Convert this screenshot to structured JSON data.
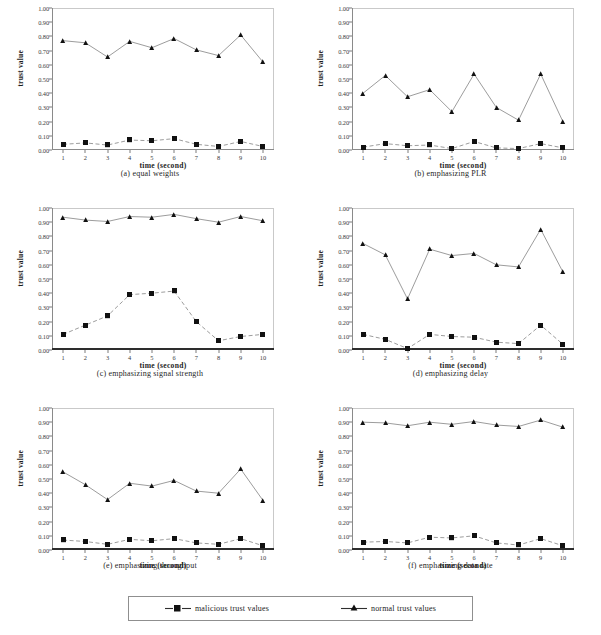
{
  "figure": {
    "xlabel": "time  (second)",
    "ylabel": "trust value",
    "x_ticks": [
      "1",
      "2",
      "3",
      "4",
      "5",
      "6",
      "7",
      "8",
      "9",
      "10"
    ],
    "y_ticks": [
      "1.00",
      "0.90",
      "0.80",
      "0.70",
      "0.60",
      "0.50",
      "0.40",
      "0.30",
      "0.20",
      "0.10",
      "0.00"
    ],
    "legend": {
      "malicious_label": "malicious trust values",
      "normal_label": "normal trust values",
      "malicious_marker": "square-marker-icon",
      "normal_marker": "triangle-marker-icon"
    },
    "colors": {
      "line": "#4a4a4a",
      "marker": "#111111",
      "axis": "#8a8a8a",
      "frame": "#c9c9c9"
    }
  },
  "chart_data": [
    {
      "type": "line",
      "panel": "a",
      "title": "(a)   equal weights",
      "xlabel": "time  (second)",
      "ylabel": "trust value",
      "x": [
        1,
        2,
        3,
        4,
        5,
        6,
        7,
        8,
        9,
        10
      ],
      "xlim": [
        0.5,
        10.5
      ],
      "ylim": [
        0,
        1
      ],
      "grid": false,
      "legend_position": "below-figure",
      "series": [
        {
          "name": "normal trust values",
          "marker": "triangle",
          "style": "solid",
          "values": [
            0.77,
            0.755,
            0.655,
            0.765,
            0.72,
            0.785,
            0.705,
            0.665,
            0.81,
            0.62
          ]
        },
        {
          "name": "malicious trust values",
          "marker": "square",
          "style": "dashed",
          "values": [
            0.04,
            0.05,
            0.035,
            0.07,
            0.065,
            0.08,
            0.04,
            0.025,
            0.06,
            0.025
          ]
        }
      ]
    },
    {
      "type": "line",
      "panel": "b",
      "title": "(b)   emphasizing PLR",
      "xlabel": "time  (second)",
      "ylabel": "trust value",
      "x": [
        1,
        2,
        3,
        4,
        5,
        6,
        7,
        8,
        9,
        10
      ],
      "xlim": [
        0.5,
        10.5
      ],
      "ylim": [
        0,
        1
      ],
      "grid": false,
      "legend_position": "below-figure",
      "series": [
        {
          "name": "normal trust values",
          "marker": "triangle",
          "style": "solid",
          "values": [
            0.4,
            0.525,
            0.375,
            0.425,
            0.27,
            0.535,
            0.3,
            0.21,
            0.535,
            0.2
          ]
        },
        {
          "name": "malicious trust values",
          "marker": "square",
          "style": "dashed",
          "values": [
            0.02,
            0.045,
            0.03,
            0.035,
            0.01,
            0.06,
            0.015,
            0.01,
            0.045,
            0.015
          ]
        }
      ]
    },
    {
      "type": "line",
      "panel": "c",
      "title": "(c)   emphasizing signal strength",
      "xlabel": "time  (second)",
      "ylabel": "trust value",
      "x": [
        1,
        2,
        3,
        4,
        5,
        6,
        7,
        8,
        9,
        10
      ],
      "xlim": [
        0.5,
        10.5
      ],
      "ylim": [
        0,
        1
      ],
      "grid": false,
      "legend_position": "below-figure",
      "series": [
        {
          "name": "normal trust values",
          "marker": "triangle",
          "style": "solid",
          "values": [
            0.935,
            0.915,
            0.905,
            0.94,
            0.935,
            0.955,
            0.925,
            0.9,
            0.94,
            0.91
          ]
        },
        {
          "name": "malicious trust values",
          "marker": "square",
          "style": "dashed",
          "values": [
            0.11,
            0.175,
            0.24,
            0.39,
            0.4,
            0.415,
            0.2,
            0.065,
            0.095,
            0.11
          ]
        }
      ]
    },
    {
      "type": "line",
      "panel": "d",
      "title": "(d)   emphasizing delay",
      "xlabel": "time  (second)",
      "ylabel": "trust value",
      "x": [
        1,
        2,
        3,
        4,
        5,
        6,
        7,
        8,
        9,
        10
      ],
      "xlim": [
        0.5,
        10.5
      ],
      "ylim": [
        0,
        1
      ],
      "grid": false,
      "legend_position": "below-figure",
      "series": [
        {
          "name": "normal trust values",
          "marker": "triangle",
          "style": "solid",
          "values": [
            0.75,
            0.67,
            0.36,
            0.71,
            0.665,
            0.68,
            0.6,
            0.585,
            0.85,
            0.55
          ]
        },
        {
          "name": "malicious trust values",
          "marker": "square",
          "style": "dashed",
          "values": [
            0.11,
            0.075,
            0.01,
            0.11,
            0.095,
            0.09,
            0.055,
            0.045,
            0.175,
            0.04
          ]
        }
      ]
    },
    {
      "type": "line",
      "panel": "e",
      "title": "(e)   emphasizing throughput",
      "xlabel": "time  (second)",
      "ylabel": "trust value",
      "x": [
        1,
        2,
        3,
        4,
        5,
        6,
        7,
        8,
        9,
        10
      ],
      "xlim": [
        0.5,
        10.5
      ],
      "ylim": [
        0,
        1
      ],
      "grid": false,
      "legend_position": "below-figure",
      "series": [
        {
          "name": "normal trust values",
          "marker": "triangle",
          "style": "solid",
          "values": [
            0.55,
            0.46,
            0.355,
            0.47,
            0.45,
            0.49,
            0.415,
            0.4,
            0.57,
            0.35
          ]
        },
        {
          "name": "malicious trust values",
          "marker": "square",
          "style": "dashed",
          "values": [
            0.07,
            0.06,
            0.04,
            0.075,
            0.065,
            0.08,
            0.05,
            0.04,
            0.08,
            0.03
          ]
        }
      ]
    },
    {
      "type": "line",
      "panel": "f",
      "title": "(f)   emphasizing data rate",
      "xlabel": "time  (second)",
      "ylabel": "trust value",
      "x": [
        1,
        2,
        3,
        4,
        5,
        6,
        7,
        8,
        9,
        10
      ],
      "xlim": [
        0.5,
        10.5
      ],
      "ylim": [
        0,
        1
      ],
      "grid": false,
      "legend_position": "below-figure",
      "series": [
        {
          "name": "normal trust values",
          "marker": "triangle",
          "style": "solid",
          "values": [
            0.9,
            0.895,
            0.875,
            0.9,
            0.885,
            0.905,
            0.88,
            0.87,
            0.915,
            0.865
          ]
        },
        {
          "name": "malicious trust values",
          "marker": "square",
          "style": "dashed",
          "values": [
            0.055,
            0.06,
            0.05,
            0.09,
            0.085,
            0.1,
            0.05,
            0.035,
            0.08,
            0.03
          ]
        }
      ]
    }
  ]
}
